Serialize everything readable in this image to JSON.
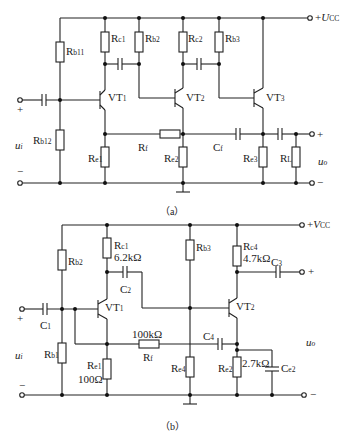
{
  "figure_a": {
    "caption": "（a）",
    "supply": {
      "prefix": "+",
      "symbol": "U",
      "sub": "CC"
    },
    "input": {
      "plus": "+",
      "minus": "−",
      "symbol": "u",
      "sub": "i"
    },
    "output": {
      "plus": "+",
      "minus": "−",
      "symbol": "u",
      "sub": "o"
    },
    "components": {
      "Rb11": {
        "base": "R",
        "sub": "b11"
      },
      "Rb12": {
        "base": "R",
        "sub": "b12"
      },
      "Rc1": {
        "base": "R",
        "sub": "c1"
      },
      "Rb2": {
        "base": "R",
        "sub": "b2"
      },
      "Rc2": {
        "base": "R",
        "sub": "c2"
      },
      "Rb3": {
        "base": "R",
        "sub": "b3"
      },
      "Re1": {
        "base": "R",
        "sub": "e1"
      },
      "Re2": {
        "base": "R",
        "sub": "e2"
      },
      "Re3": {
        "base": "R",
        "sub": "e3"
      },
      "RL": {
        "base": "R",
        "sub": "L"
      },
      "Rf": {
        "base": "R",
        "sub": "f"
      },
      "Cf": {
        "base": "C",
        "sub": "f"
      },
      "VT1": {
        "base": "VT",
        "sub": "1"
      },
      "VT2": {
        "base": "VT",
        "sub": "2"
      },
      "VT3": {
        "base": "VT",
        "sub": "3"
      }
    }
  },
  "figure_b": {
    "caption": "（b）",
    "supply": {
      "prefix": "+",
      "symbol": "V",
      "sub": "CC"
    },
    "input": {
      "plus": "+",
      "minus": "−",
      "symbol": "u",
      "sub": "i"
    },
    "output": {
      "plus": "+",
      "minus": "−",
      "symbol": "u",
      "sub": "o"
    },
    "components": {
      "Rb2": {
        "base": "R",
        "sub": "b2"
      },
      "Rb1": {
        "base": "R",
        "sub": "b1"
      },
      "Rc1": {
        "base": "R",
        "sub": "c1",
        "value": "6.2kΩ"
      },
      "Rb3": {
        "base": "R",
        "sub": "b3"
      },
      "Rc4": {
        "base": "R",
        "sub": "c4",
        "value": "4.7kΩ"
      },
      "Re1": {
        "base": "R",
        "sub": "e1",
        "value": "100Ω"
      },
      "Re4": {
        "base": "R",
        "sub": "e4"
      },
      "Re2": {
        "base": "R",
        "sub": "e2",
        "value": "2.7kΩ"
      },
      "Rf": {
        "base": "R",
        "sub": "f",
        "value": "100kΩ"
      },
      "C1": {
        "base": "C",
        "sub": "1"
      },
      "C2": {
        "base": "C",
        "sub": "2"
      },
      "C3": {
        "base": "C",
        "sub": "3"
      },
      "C4": {
        "base": "C",
        "sub": "4"
      },
      "Ce2": {
        "base": "C",
        "sub": "e2"
      },
      "VT1": {
        "base": "VT",
        "sub": "1"
      },
      "VT2": {
        "base": "VT",
        "sub": "2"
      }
    }
  }
}
